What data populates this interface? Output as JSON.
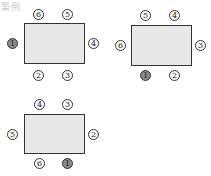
{
  "label": "築例",
  "colors": {
    "table_fill": "#e8e8e8",
    "highlight_seat": "#8a8a8a",
    "stroke": "#333333"
  },
  "diagrams": [
    {
      "name": "arrangement-1",
      "seats": {
        "left": "1",
        "top_left": "6",
        "top_right": "5",
        "right": "4",
        "bottom_left": "2",
        "bottom_right": "3"
      },
      "highlighted": "left"
    },
    {
      "name": "arrangement-2",
      "seats": {
        "left": "6",
        "top_left": "5",
        "top_right": "4",
        "right": "3",
        "bottom_left": "1",
        "bottom_right": "2"
      },
      "highlighted": "bottom_left"
    },
    {
      "name": "arrangement-3",
      "seats": {
        "left": "5",
        "top_left": "4",
        "top_right": "3",
        "right": "2",
        "bottom_left": "6",
        "bottom_right": "1"
      },
      "highlighted": "bottom_right"
    }
  ]
}
